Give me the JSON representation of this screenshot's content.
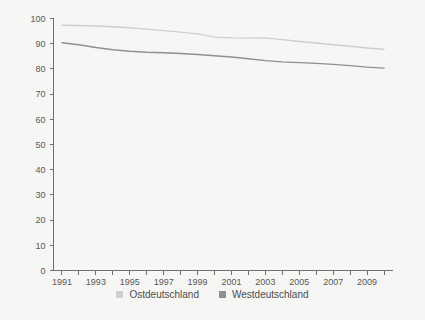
{
  "chart_data": {
    "type": "line",
    "title": "",
    "subtitle": "",
    "xlabel": "",
    "ylabel": "",
    "x": [
      1991,
      1992,
      1993,
      1994,
      1995,
      1996,
      1997,
      1998,
      1999,
      2000,
      2001,
      2002,
      2003,
      2004,
      2005,
      2006,
      2007,
      2008,
      2009,
      2010
    ],
    "xlim": [
      1990.5,
      2010.5
    ],
    "ylim": [
      0,
      100
    ],
    "ytick_values": [
      0,
      10,
      20,
      30,
      40,
      50,
      60,
      70,
      80,
      90,
      100
    ],
    "ytick_labels": [
      "0",
      "10",
      "20",
      "30",
      "40",
      "50",
      "60",
      "70",
      "80",
      "90",
      "100"
    ],
    "xtick_values": [
      1991,
      1992,
      1993,
      1994,
      1995,
      1996,
      1997,
      1998,
      1999,
      2000,
      2001,
      2002,
      2003,
      2004,
      2005,
      2006,
      2007,
      2008,
      2009,
      2010
    ],
    "xtick_labels": [
      "1991",
      "",
      "1993",
      "",
      "1995",
      "",
      "1997",
      "",
      "1999",
      "",
      "2001",
      "",
      "2003",
      "",
      "2005",
      "",
      "2007",
      "",
      "2009",
      ""
    ],
    "grid": false,
    "legend_position": "bottom",
    "series": [
      {
        "name": "Ostdeutschland",
        "color": "#cfd0ce",
        "values": [
          97.3,
          97.2,
          97.0,
          96.7,
          96.3,
          95.8,
          95.2,
          94.6,
          93.9,
          92.6,
          92.3,
          92.2,
          92.3,
          91.6,
          90.9,
          90.3,
          89.6,
          89.0,
          88.3,
          87.8
        ]
      },
      {
        "name": "Westdeutschland",
        "color": "#8e9092",
        "values": [
          90.4,
          89.6,
          88.5,
          87.6,
          87.0,
          86.6,
          86.4,
          86.1,
          85.7,
          85.2,
          84.7,
          84.0,
          83.3,
          82.8,
          82.5,
          82.2,
          81.8,
          81.3,
          80.7,
          80.3
        ]
      }
    ]
  },
  "legend": {
    "items": [
      {
        "label": "Ostdeutschland",
        "color": "#cfd0ce"
      },
      {
        "label": "Westdeutschland",
        "color": "#8e9092"
      }
    ]
  },
  "colors": {
    "background": "#f6f6f4",
    "axis": "#6d6f71",
    "tick_text": "#56585a",
    "legend_text": "#4a4c4e"
  }
}
